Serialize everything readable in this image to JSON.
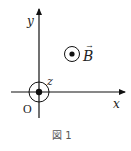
{
  "figure": {
    "caption": "図 1",
    "axes": {
      "x_label": "x",
      "y_label": "y",
      "z_label": "z",
      "origin_label": "O"
    },
    "field": {
      "symbol": "B",
      "vector_arrow": "→",
      "direction": "out of page (dot-in-circle)"
    },
    "origin_marker": "dot-in-circle (z-axis out of page)"
  }
}
